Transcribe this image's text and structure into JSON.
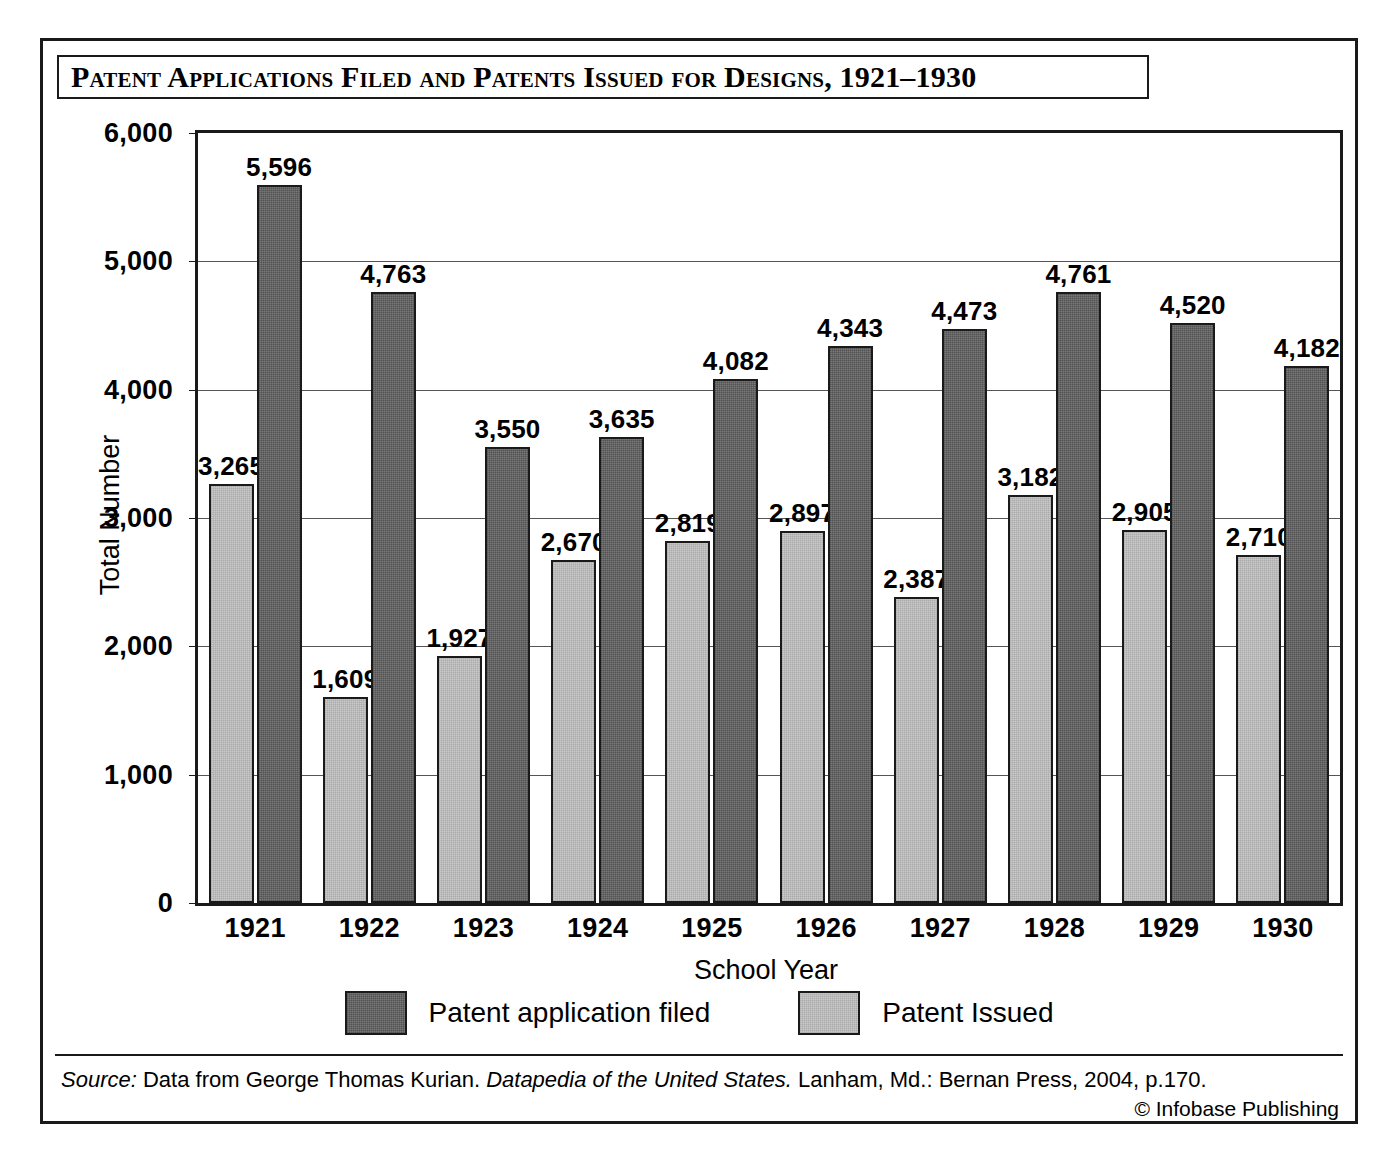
{
  "title": "Patent Applications Filed and Patents Issued for Designs, 1921–1930",
  "chart_data": {
    "type": "bar",
    "title": "Patent Applications Filed and Patents Issued for Designs, 1921–1930",
    "xlabel": "School Year",
    "ylabel": "Total Number",
    "ylim": [
      0,
      6000
    ],
    "ytick_values": [
      0,
      1000,
      2000,
      3000,
      4000,
      5000,
      6000
    ],
    "ytick_labels": [
      "0",
      "1,000",
      "2,000",
      "3,000",
      "4,000",
      "5,000",
      "6,000"
    ],
    "grid": true,
    "legend_position": "bottom",
    "categories": [
      "1921",
      "1922",
      "1923",
      "1924",
      "1925",
      "1926",
      "1927",
      "1928",
      "1929",
      "1930"
    ],
    "series": [
      {
        "name": "Patent Issued",
        "key": "issued",
        "color": "#c9c9c9",
        "draw_order": 1,
        "values": [
          3265,
          1609,
          1927,
          2670,
          2819,
          2897,
          2387,
          3182,
          2905,
          2710
        ],
        "labels": [
          "3,265",
          "1,609",
          "1,927",
          "2,670",
          "2,819",
          "2,897",
          "2,387",
          "3,182",
          "2,905",
          "2,710"
        ]
      },
      {
        "name": "Patent application filed",
        "key": "filed",
        "color": "#666666",
        "draw_order": 2,
        "values": [
          5596,
          4763,
          3550,
          3635,
          4082,
          4343,
          4473,
          4761,
          4520,
          4182
        ],
        "labels": [
          "5,596",
          "4,763",
          "3,550",
          "3,635",
          "4,082",
          "4,343",
          "4,473",
          "4,761",
          "4,520",
          "4,182"
        ]
      }
    ]
  },
  "legend": [
    {
      "label": "Patent application filed",
      "key": "filed"
    },
    {
      "label": "Patent Issued",
      "key": "issued"
    }
  ],
  "footer": {
    "source_prefix": "Source:",
    "source_text_1": " Data from George Thomas Kurian. ",
    "source_italic": "Datapedia of the United States.",
    "source_text_2": " Lanham, Md.: Bernan Press, 2004, p.170.",
    "copyright": "© Infobase Publishing"
  }
}
